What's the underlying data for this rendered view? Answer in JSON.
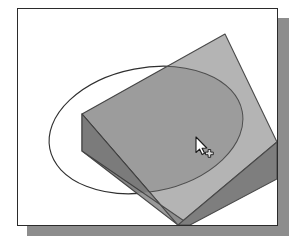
{
  "window": {
    "title": "3D Viewport",
    "frame_border_color": "#2b2b2b",
    "frame_background": "#ffffff",
    "shadow_color": "#8d8d8d",
    "page_background": "#ffffff"
  },
  "viewport": {
    "name": "3d-modeling-viewport",
    "background": "#ffffff",
    "width": 259,
    "height": 216
  },
  "scene": {
    "description": "Isometric extruded slab with a circular construction ellipse and a shaded circular region",
    "objects": [
      {
        "id": "slab",
        "name": "extruded-slab",
        "type": "box",
        "faces": [
          {
            "id": "top",
            "name": "slab-top-face",
            "color": "#b4b4b4"
          },
          {
            "id": "front-left",
            "name": "slab-front-left-face",
            "color": "#9a9a9a"
          },
          {
            "id": "front-right",
            "name": "slab-front-right-face",
            "color": "#7e7e7e"
          }
        ],
        "edge_color": "#4a4a4a",
        "vertices": {
          "top_apex": [
            207,
            25
          ],
          "top_left": [
            64,
            105
          ],
          "top_right": [
            259,
            133
          ],
          "top_bottom": [
            160,
            216
          ],
          "front_left_lower": [
            64,
            142
          ],
          "front_bottom_lower": [
            160,
            216
          ],
          "right_lower": [
            259,
            170
          ]
        }
      },
      {
        "id": "construction-circle",
        "name": "construction-ellipse",
        "type": "ellipse-outline",
        "stroke": "#2f2f2f",
        "stroke_width": 1.1,
        "center": [
          128,
          121
        ],
        "rx": 98,
        "ry": 62,
        "rotation_deg": -11
      },
      {
        "id": "shaded-region",
        "name": "circular-shaded-region",
        "type": "ellipse-fill",
        "fill": "#000000",
        "opacity": 0.13,
        "center": [
          128,
          121
        ],
        "rx": 98,
        "ry": 62,
        "rotation_deg": -11
      }
    ]
  },
  "cursor": {
    "name": "arrow-cursor-with-crosshair",
    "type": "pointer-with-add-badge",
    "position": [
      195,
      144
    ],
    "arrow_fill": "#ffffff",
    "arrow_outline": "#1a1a1a",
    "badge_icon": "crosshair-plus-icon",
    "badge_fill": "#dcdcdc",
    "badge_outline": "#1a1a1a"
  },
  "colors": {
    "slab_top": "#b4b4b4",
    "slab_front_left": "#9a9a9a",
    "slab_front_right": "#7e7e7e",
    "overlay_dark": "#000000",
    "edge": "#4a4a4a",
    "ellipse_stroke": "#2f2f2f",
    "frame_border": "#2b2b2b",
    "shadow": "#8d8d8d"
  }
}
